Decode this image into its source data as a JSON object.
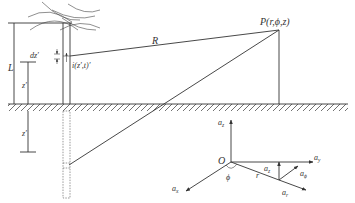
{
  "diagram": {
    "type": "physics-geometry",
    "labels": {
      "point": "P(r,ϕ,z)",
      "distance": "R",
      "height": "L",
      "element": "dz′",
      "source_height": "z′",
      "image_depth": "z′",
      "current": "i(z′,t)′",
      "origin": "O",
      "angle": "ϕ",
      "radius": "r",
      "unit_z": "a",
      "unit_z_sub": "z",
      "unit_y": "a",
      "unit_y_sub": "y",
      "unit_x": "a",
      "unit_x_sub": "x",
      "unit_r": "a",
      "unit_r_sub": "r",
      "unit_phi": "a",
      "unit_phi_sub": "ϕ",
      "unit_z2": "a",
      "unit_z2_sub": "z"
    },
    "colors": {
      "line": "#333333",
      "background": "#ffffff"
    }
  }
}
